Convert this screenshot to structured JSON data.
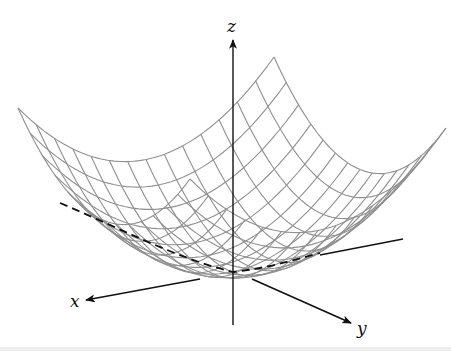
{
  "figure": {
    "axes": {
      "z_label": "z",
      "x_label": "x",
      "y_label": "y"
    },
    "colors": {
      "mesh": "#8f8f8f",
      "axes": "#111111",
      "dashed_curve": "#111111",
      "background": "#ffffff"
    },
    "projection": {
      "origin": [
        232,
        272
      ],
      "ex": [
        -128,
        25.5
      ],
      "ey": [
        86,
        35.5
      ],
      "z_scale": 154
    },
    "surface": {
      "type": "paraboloid",
      "equation": "z = (x^2 + y^2)/2",
      "grid_lines_per_direction": 15,
      "domain": [
        -1,
        1
      ]
    },
    "dashed_curve": {
      "description": "trace of surface in the plane y = -x... (cross-section through vertex)"
    }
  }
}
